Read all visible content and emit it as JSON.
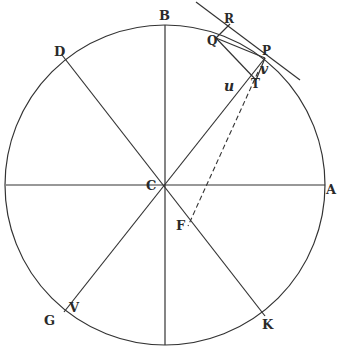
{
  "figure": {
    "type": "geometric-diagram",
    "stroke_color": "#333333",
    "background": "#ffffff",
    "circle": {
      "cx": 165,
      "cy": 185,
      "r": 160
    },
    "labels": {
      "A": "A",
      "B": "B",
      "C": "C",
      "D": "D",
      "F": "F",
      "G": "G",
      "K": "K",
      "P": "P",
      "Q": "Q",
      "R": "R",
      "T": "T",
      "V": "V",
      "u": "u",
      "v": "v"
    }
  }
}
